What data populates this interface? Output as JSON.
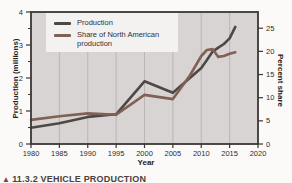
{
  "figure": {
    "caption_marker": "▲",
    "caption_text": "11.3.2 VEHICLE PRODUCTION"
  },
  "colors": {
    "plot_bg": "#d8d4d3",
    "gridline": "#b7b2b0",
    "frame": "#3a3736",
    "tick_text": "#2f2c2b",
    "legend_bg": "#f4f2f1"
  },
  "chart_data": {
    "type": "line",
    "title": "",
    "xlabel": "Year",
    "ylabel_left": "Production (millions)",
    "ylabel_right": "Percent share",
    "x_range": [
      1980,
      2020
    ],
    "y_left_range": [
      0,
      4
    ],
    "y_right_range": [
      0,
      28.5
    ],
    "x_ticks": [
      1980,
      1985,
      1990,
      1995,
      2000,
      2005,
      2010,
      2015,
      2020
    ],
    "y_left_ticks": [
      0,
      1,
      2,
      3,
      4
    ],
    "y_left_minor_ticks": [
      0.5,
      1.5,
      2.5,
      3.5
    ],
    "y_right_ticks": [
      0,
      5,
      10,
      15,
      20,
      25
    ],
    "grid": "vertical-only",
    "legend_position": "top-left-inside",
    "series": [
      {
        "name": "Production",
        "axis": "left",
        "color": "#4d4846",
        "points": [
          [
            1980,
            0.49
          ],
          [
            1985,
            0.63
          ],
          [
            1990,
            0.82
          ],
          [
            1995,
            0.9
          ],
          [
            2000,
            1.9
          ],
          [
            2005,
            1.55
          ],
          [
            2010,
            2.3
          ],
          [
            2011,
            2.55
          ],
          [
            2012,
            2.8
          ],
          [
            2013,
            2.92
          ],
          [
            2014,
            3.03
          ],
          [
            2015,
            3.2
          ],
          [
            2016,
            3.55
          ]
        ]
      },
      {
        "name": "Share of North American production",
        "axis": "right",
        "color": "#826056",
        "points": [
          [
            1980,
            5.2
          ],
          [
            1985,
            6.0
          ],
          [
            1990,
            6.6
          ],
          [
            1995,
            6.3
          ],
          [
            2000,
            10.6
          ],
          [
            2005,
            9.7
          ],
          [
            2008,
            14.8
          ],
          [
            2010,
            19.0
          ],
          [
            2011,
            20.3
          ],
          [
            2012,
            20.5
          ],
          [
            2013,
            18.8
          ],
          [
            2014,
            19.0
          ],
          [
            2015,
            19.5
          ],
          [
            2016,
            19.8
          ]
        ]
      }
    ]
  }
}
